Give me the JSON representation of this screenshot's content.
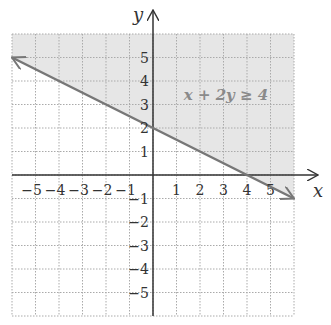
{
  "chart_data": {
    "type": "line",
    "title": "",
    "inequality": "x + 2y ≥ 4",
    "xlabel": "x",
    "ylabel": "y",
    "xlim": [
      -6,
      6
    ],
    "ylim": [
      -6,
      6
    ],
    "grid": true,
    "grid_style": "dotted",
    "x_ticks": [
      -5,
      -4,
      -3,
      -2,
      -1,
      1,
      2,
      3,
      4,
      5
    ],
    "y_ticks": [
      5,
      4,
      3,
      2,
      1,
      -1,
      -2,
      -3,
      -4,
      -5
    ],
    "x_tick_labels": [
      "−5",
      "−4",
      "−3",
      "−2",
      "−1",
      "1",
      "2",
      "3",
      "4",
      "5"
    ],
    "y_tick_labels": [
      "5",
      "4",
      "3",
      "2",
      "1",
      "−1",
      "−2",
      "−3",
      "−4",
      "−5"
    ],
    "boundary_line": {
      "equation": "x + 2y = 4",
      "style": "solid",
      "points": [
        [
          -6,
          5
        ],
        [
          0,
          2
        ],
        [
          4,
          0
        ],
        [
          6,
          -1
        ]
      ],
      "arrows": "both"
    },
    "shaded_region": "above line (x + 2y ≥ 4)",
    "colors": {
      "line": "#777777",
      "shade": "#e6e6e6",
      "grid": "#aaaaaa",
      "axes": "#333333",
      "label": "#8a8a8a"
    }
  }
}
